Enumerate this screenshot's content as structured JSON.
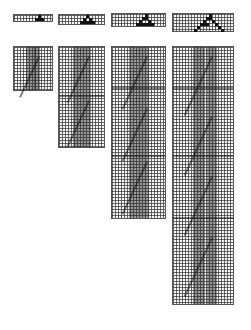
{
  "figure": {
    "top_row": [
      {
        "id": "init-1",
        "x": 13,
        "y": 14,
        "w": 40,
        "h": 8,
        "cells": [
          [
            8,
            0
          ],
          [
            7,
            1
          ],
          [
            8,
            1
          ],
          [
            9,
            1
          ]
        ]
      },
      {
        "id": "init-2",
        "x": 58,
        "y": 14,
        "w": 47,
        "h": 11,
        "cells": [
          [
            9,
            0
          ],
          [
            8,
            1
          ],
          [
            10,
            1
          ],
          [
            7,
            2
          ],
          [
            8,
            2
          ],
          [
            9,
            2
          ],
          [
            10,
            2
          ],
          [
            11,
            2
          ]
        ]
      },
      {
        "id": "init-3",
        "x": 111,
        "y": 13,
        "w": 55,
        "h": 14,
        "cells": [
          [
            11,
            0
          ],
          [
            10,
            1
          ],
          [
            11,
            1
          ],
          [
            9,
            2
          ],
          [
            12,
            2
          ],
          [
            8,
            3
          ],
          [
            9,
            3
          ],
          [
            10,
            3
          ],
          [
            11,
            3
          ],
          [
            12,
            3
          ],
          [
            13,
            3
          ]
        ]
      },
      {
        "id": "init-4",
        "x": 172,
        "y": 13,
        "w": 62,
        "h": 19,
        "cells": [
          [
            12,
            0
          ],
          [
            11,
            1
          ],
          [
            12,
            1
          ],
          [
            10,
            2
          ],
          [
            13,
            2
          ],
          [
            9,
            3
          ],
          [
            10,
            3
          ],
          [
            11,
            3
          ],
          [
            14,
            3
          ],
          [
            8,
            4
          ],
          [
            15,
            4
          ],
          [
            7,
            5
          ],
          [
            16,
            5
          ]
        ]
      }
    ],
    "bottom_row": [
      {
        "id": "evolution-1",
        "x": 13,
        "y": 46,
        "w": 40,
        "h": 45,
        "bands": [
          [
            12,
            10
          ],
          [
            20,
            6
          ]
        ],
        "seps": []
      },
      {
        "id": "evolution-2",
        "x": 58,
        "y": 46,
        "w": 47,
        "h": 102,
        "bands": [
          [
            14,
            10
          ],
          [
            24,
            8
          ]
        ],
        "seps": [
          48
        ]
      },
      {
        "id": "evolution-3",
        "x": 111,
        "y": 46,
        "w": 55,
        "h": 173,
        "bands": [
          [
            17,
            12
          ],
          [
            29,
            8
          ]
        ],
        "seps": [
          40,
          108
        ]
      },
      {
        "id": "evolution-4",
        "x": 172,
        "y": 46,
        "w": 62,
        "h": 259,
        "bands": [
          [
            20,
            12
          ],
          [
            34,
            10
          ]
        ],
        "seps": [
          40,
          108,
          170
        ]
      }
    ],
    "colors": {
      "grid_line": "#555555",
      "cell": "#111111",
      "background": "#ffffff"
    }
  }
}
